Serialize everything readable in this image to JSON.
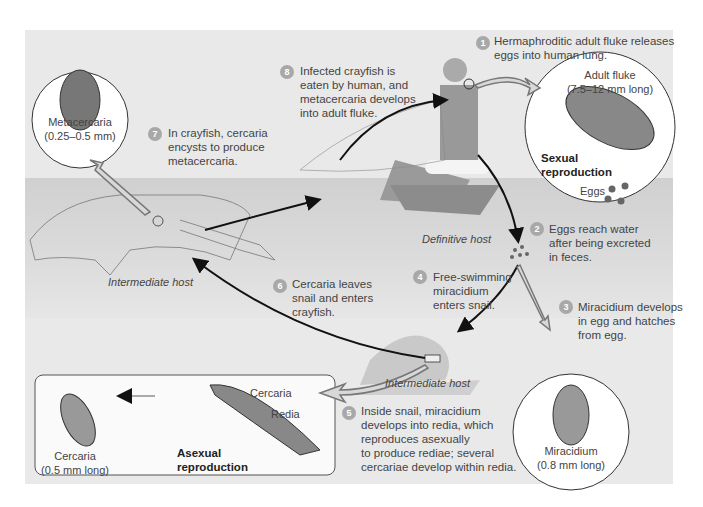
{
  "diagram": {
    "type": "life-cycle",
    "steps": [
      {
        "num": "1",
        "text_lines": [
          "Hermaphroditic adult fluke releases",
          "eggs into human lung."
        ]
      },
      {
        "num": "2",
        "text_lines": [
          "Eggs reach water",
          "after being excreted",
          "in feces."
        ]
      },
      {
        "num": "3",
        "text_lines": [
          "Miracidium develops",
          "in egg and hatches",
          "from egg."
        ]
      },
      {
        "num": "4",
        "text_lines": [
          "Free-swimming",
          "miracidium",
          "enters snail."
        ]
      },
      {
        "num": "5",
        "text_lines": [
          "Inside snail, miracidium",
          "develops into redia, which",
          "reproduces asexually",
          "to produce rediae; several",
          "cercariae develop within redia."
        ]
      },
      {
        "num": "6",
        "text_lines": [
          "Cercaria leaves",
          "snail and enters",
          "crayfish."
        ]
      },
      {
        "num": "7",
        "text_lines": [
          "In crayfish, cercaria",
          "encysts to produce",
          "metacercaria."
        ]
      },
      {
        "num": "8",
        "text_lines": [
          "Infected crayfish is",
          "eaten by human, and",
          "metacercaria develops",
          "into adult fluke."
        ]
      }
    ],
    "stages": {
      "adult_fluke": {
        "name": "Adult fluke",
        "size": "(7.5–12 mm long)",
        "note_lines": [
          "Sexual",
          "reproduction"
        ],
        "eggs_label": "Eggs"
      },
      "miracidium": {
        "name": "Miracidium",
        "size": "(0.8 mm long)"
      },
      "metacercaria": {
        "name": "Metacercaria",
        "size": "(0.25–0.5 mm)"
      },
      "cercaria": {
        "name": "Cercaria",
        "size": "(0.5 mm long)"
      },
      "redia_box": {
        "cercaria_label": "Cercaria",
        "redia_label": "Redia",
        "note_lines": [
          "Asexual",
          "reproduction"
        ]
      }
    },
    "hosts": {
      "definitive": "Definitive host",
      "intermediate_crayfish": "Intermediate host",
      "intermediate_snail": "Intermediate host"
    },
    "colors": {
      "panel": "#e9e9e9",
      "water": "#d2d2d2",
      "badge": "#a8a8a8",
      "arrow": "#111111"
    }
  }
}
